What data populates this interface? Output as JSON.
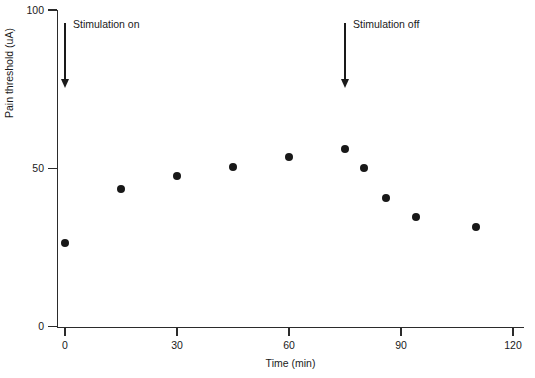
{
  "chart_data": {
    "type": "scatter",
    "title": "",
    "xlabel": "Time (min)",
    "ylabel": "Pain threshold (uA)",
    "xlim": [
      0,
      120
    ],
    "ylim": [
      0,
      100
    ],
    "xticks": [
      0,
      30,
      60,
      90,
      120
    ],
    "yticks": [
      0,
      50,
      100
    ],
    "xtick_labels": [
      "0",
      "30",
      "60",
      "90",
      "120"
    ],
    "ytick_labels": [
      "0",
      "50",
      "100"
    ],
    "grid": false,
    "legend": false,
    "marker": "filled-circle",
    "marker_color": "#181818",
    "series": [
      {
        "name": "Pain threshold",
        "x": [
          0,
          15,
          30,
          45,
          60,
          75,
          80,
          86,
          94,
          110
        ],
        "y": [
          26.5,
          43.5,
          47.5,
          50.5,
          53.5,
          56,
          50,
          40.5,
          34.5,
          31.5
        ]
      }
    ],
    "annotations": [
      {
        "id": "stimulation-on",
        "label": "Stimulation on",
        "x": 0,
        "arrow": "down",
        "arrow_top_value": 96,
        "arrow_bottom_value": 76
      },
      {
        "id": "stimulation-off",
        "label": "Stimulation off",
        "x": 75,
        "arrow": "down",
        "arrow_top_value": 96,
        "arrow_bottom_value": 76
      }
    ]
  },
  "axes": {
    "y_title": "Pain threshold (uA)",
    "x_title": "Time (min)",
    "y_labels": [
      "100",
      "50",
      "0"
    ],
    "x_labels": [
      "0",
      "30",
      "60",
      "90",
      "120"
    ]
  },
  "annotations": {
    "on_label": "Stimulation on",
    "off_label": "Stimulation off"
  },
  "colors": {
    "axis": "#2b2b2b",
    "marker": "#181818",
    "text": "#1a1a1a",
    "background": "#ffffff"
  }
}
